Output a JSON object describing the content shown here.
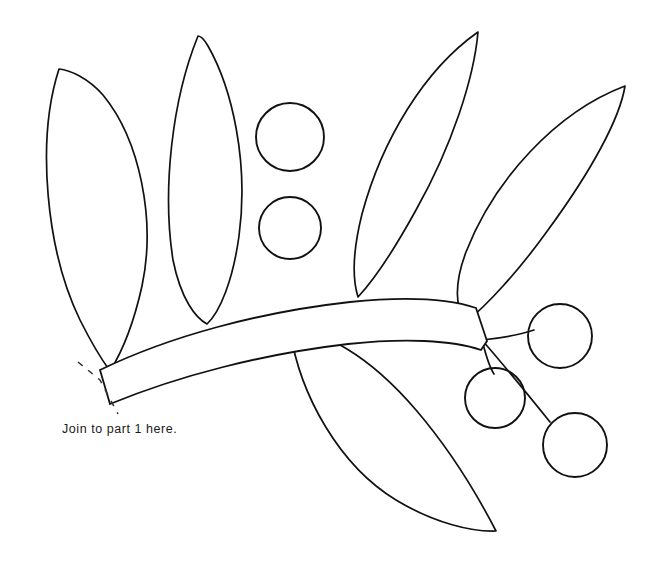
{
  "document": {
    "title": "Applique Pattern Template - Branch Part 2",
    "kind": "line-art pattern sheet",
    "background_color": "#ffffff",
    "ink_color": "#111111"
  },
  "caption": {
    "join_note": "Join to part 1 here."
  },
  "chart_data": {
    "type": "diagram",
    "background": "#ffffff",
    "stroke": "#111111",
    "leaves": [
      {
        "name": "leaf-1-far-left",
        "tip": [
          59,
          69
        ],
        "base": [
          110,
          371
        ],
        "orientation": "leaning-left",
        "path": "M59,69 C36,140 46,250 80,320 C92,344 102,360 110,371 C122,352 134,322 142,286 C156,220 140,140 103,95 C88,78 70,70 59,69 Z"
      },
      {
        "name": "leaf-2-upright",
        "tip": [
          198,
          36
        ],
        "base": [
          207,
          324
        ],
        "orientation": "vertical",
        "path": "M198,36 C172,100 162,190 173,260 C181,300 196,318 207,324 C220,312 233,280 239,236 C249,162 232,88 208,46 C204,39 201,36 198,36 Z"
      },
      {
        "name": "leaf-3-center-right",
        "tip": [
          478,
          32
        ],
        "base": [
          358,
          297
        ],
        "orientation": "leaning-right",
        "path": "M478,32 C424,70 382,140 362,214 C353,250 352,278 358,297 C372,282 394,250 416,210 C452,146 474,78 478,32 Z"
      },
      {
        "name": "leaf-4-far-right",
        "tip": [
          625,
          86
        ],
        "base": [
          466,
          322
        ],
        "orientation": "leaning-right",
        "path": "M625,86 C556,112 494,180 466,252 C454,284 455,308 466,322 C486,306 518,272 548,230 C592,170 620,118 625,86 Z"
      },
      {
        "name": "leaf-5-bottom",
        "tip": [
          496,
          531
        ],
        "base": [
          290,
          330
        ],
        "orientation": "lower-right",
        "path": "M290,330 C300,396 340,466 396,500 C434,523 472,532 496,531 C480,500 452,452 416,410 C368,354 322,330 290,330 Z"
      }
    ],
    "berries": [
      {
        "name": "berry-upper-left",
        "cx": 290,
        "cy": 137,
        "rx": 34,
        "ry": 34
      },
      {
        "name": "berry-lower-left",
        "cx": 290,
        "cy": 228,
        "rx": 31,
        "ry": 31
      },
      {
        "name": "berry-upper-right",
        "cx": 560,
        "cy": 336,
        "rx": 32,
        "ry": 32
      },
      {
        "name": "berry-middle-right",
        "cx": 495,
        "cy": 398,
        "rx": 30,
        "ry": 30
      },
      {
        "name": "berry-lower-right",
        "cx": 575,
        "cy": 445,
        "rx": 32,
        "ry": 32
      }
    ],
    "branch": {
      "name": "tapered-curved-branch",
      "left_end": [
        100,
        370
      ],
      "right_tip": [
        487,
        341
      ],
      "description": "tapered band curving up from lower left to a cut tip at right",
      "path": "M100,370 C170,336 260,312 350,302 C410,296 452,300 476,308 L487,341 L481,350 C452,340 404,338 348,344 C262,354 178,376 110,404 Z"
    },
    "berry_stems": [
      {
        "name": "stem-to-upper-right-berry",
        "path": "M482,340 C502,338 522,334 534,330"
      },
      {
        "name": "stem-to-middle-right-berry",
        "path": "M482,340 C486,356 490,368 494,374"
      },
      {
        "name": "stem-to-lower-right-berry",
        "path": "M482,340 C508,370 534,402 550,422"
      }
    ],
    "join_marks": {
      "name": "dashed-join-line",
      "path": "M78,362 L100,380 L118,414",
      "style": "dashed"
    },
    "annotations": [
      {
        "name": "join-note",
        "text": "Join to part 1 here.",
        "x": 62,
        "y": 432
      }
    ]
  }
}
